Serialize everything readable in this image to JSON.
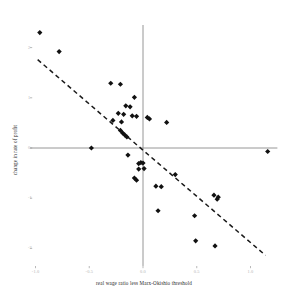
{
  "chart_data": {
    "type": "scatter",
    "title": "",
    "xlabel": "real wage ratio less Marx-Okishio threshold",
    "ylabel": "change in rate of profit",
    "xlim": [
      -1.05,
      1.25
    ],
    "ylim": [
      -2.35,
      2.45
    ],
    "xticks": [
      -1.0,
      -0.5,
      0.0,
      0.5,
      1.0
    ],
    "xtick_labels": [
      "-1.0",
      "-0.5",
      "0.0",
      "0.5",
      "1.0"
    ],
    "yticks": [
      2,
      1,
      0,
      -1,
      -2
    ],
    "ytick_labels": [
      "2",
      "1",
      "0",
      "-1",
      "-2"
    ],
    "grid": false,
    "legend": null,
    "marker": "diamond",
    "marker_color": "#111111",
    "axis_color": "#8a8a8a",
    "trendline": {
      "style": "dashed",
      "color": "#1a1a1a",
      "x_start": -0.98,
      "y_start": 1.76,
      "x_end": 1.14,
      "y_end": -2.14
    },
    "points": [
      {
        "x": -0.96,
        "y": 2.3
      },
      {
        "x": -0.78,
        "y": 1.92
      },
      {
        "x": -0.3,
        "y": 1.29
      },
      {
        "x": -0.21,
        "y": 1.27
      },
      {
        "x": -0.08,
        "y": 1.01
      },
      {
        "x": -0.16,
        "y": 0.84
      },
      {
        "x": -0.12,
        "y": 0.82
      },
      {
        "x": -0.23,
        "y": 0.69
      },
      {
        "x": -0.18,
        "y": 0.67
      },
      {
        "x": -0.1,
        "y": 0.64
      },
      {
        "x": -0.06,
        "y": 0.63
      },
      {
        "x": 0.04,
        "y": 0.61
      },
      {
        "x": 0.06,
        "y": 0.58
      },
      {
        "x": -0.28,
        "y": 0.55
      },
      {
        "x": -0.2,
        "y": 0.52
      },
      {
        "x": 0.22,
        "y": 0.51
      },
      {
        "x": -0.21,
        "y": 0.35
      },
      {
        "x": -0.19,
        "y": 0.3
      },
      {
        "x": -0.17,
        "y": 0.26
      },
      {
        "x": -0.15,
        "y": 0.22
      },
      {
        "x": -0.48,
        "y": 0.0
      },
      {
        "x": 1.16,
        "y": -0.07
      },
      {
        "x": -0.14,
        "y": -0.14
      },
      {
        "x": -0.04,
        "y": -0.31
      },
      {
        "x": -0.02,
        "y": -0.29
      },
      {
        "x": 0.0,
        "y": -0.3
      },
      {
        "x": -0.04,
        "y": -0.42
      },
      {
        "x": 0.01,
        "y": -0.41
      },
      {
        "x": -0.08,
        "y": -0.6
      },
      {
        "x": -0.06,
        "y": -0.64
      },
      {
        "x": 0.3,
        "y": -0.53
      },
      {
        "x": 0.12,
        "y": -0.76
      },
      {
        "x": 0.17,
        "y": -0.77
      },
      {
        "x": 0.66,
        "y": -0.94
      },
      {
        "x": 0.7,
        "y": -0.98
      },
      {
        "x": 0.69,
        "y": -1.02
      },
      {
        "x": 0.14,
        "y": -1.25
      },
      {
        "x": 0.48,
        "y": -1.35
      },
      {
        "x": 0.49,
        "y": -1.85
      },
      {
        "x": 0.67,
        "y": -1.95
      }
    ]
  }
}
